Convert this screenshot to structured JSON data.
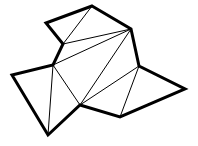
{
  "diagram": {
    "type": "polygon-triangulation",
    "stroke_color": "#000000",
    "background": "#ffffff",
    "vertices": [
      {
        "id": "A",
        "x": 92,
        "y": 6
      },
      {
        "id": "B",
        "x": 131,
        "y": 29
      },
      {
        "id": "C",
        "x": 139,
        "y": 66
      },
      {
        "id": "D",
        "x": 185,
        "y": 89
      },
      {
        "id": "E",
        "x": 120,
        "y": 117
      },
      {
        "id": "F",
        "x": 80,
        "y": 105
      },
      {
        "id": "G",
        "x": 48,
        "y": 135
      },
      {
        "id": "H",
        "x": 12,
        "y": 75
      },
      {
        "id": "I",
        "x": 53,
        "y": 65
      },
      {
        "id": "J",
        "x": 63,
        "y": 44
      },
      {
        "id": "K",
        "x": 46,
        "y": 23
      }
    ],
    "boundary_points": "92,6 131,29 139,66 185,89 120,117 80,105 48,135 12,75 53,65 63,44 46,23",
    "diagonals": [
      {
        "from": "A",
        "to": "J",
        "x1": 92,
        "y1": 6,
        "x2": 63,
        "y2": 44
      },
      {
        "from": "J",
        "to": "B",
        "x1": 63,
        "y1": 44,
        "x2": 131,
        "y2": 29
      },
      {
        "from": "I",
        "to": "B",
        "x1": 53,
        "y1": 65,
        "x2": 131,
        "y2": 29
      },
      {
        "from": "I",
        "to": "F",
        "x1": 53,
        "y1": 65,
        "x2": 80,
        "y2": 105
      },
      {
        "from": "I",
        "to": "G",
        "x1": 53,
        "y1": 65,
        "x2": 48,
        "y2": 135
      },
      {
        "from": "F",
        "to": "B",
        "x1": 80,
        "y1": 105,
        "x2": 131,
        "y2": 29
      },
      {
        "from": "F",
        "to": "C",
        "x1": 80,
        "y1": 105,
        "x2": 139,
        "y2": 66
      },
      {
        "from": "C",
        "to": "E",
        "x1": 139,
        "y1": 66,
        "x2": 120,
        "y2": 117
      }
    ]
  }
}
